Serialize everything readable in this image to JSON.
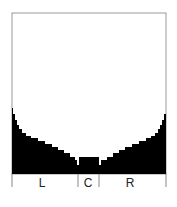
{
  "diagram": {
    "type": "histogram-profile",
    "frame": {
      "left": 12,
      "top": 13,
      "right": 166,
      "baseline": 174
    },
    "colors": {
      "fill": "#000000",
      "frame": "#999999",
      "background": "#ffffff"
    },
    "sections": [
      {
        "label": "L",
        "x_start": 12,
        "x_end": 78
      },
      {
        "label": "C",
        "x_start": 78,
        "x_end": 99
      },
      {
        "label": "R",
        "x_start": 99,
        "x_end": 166
      }
    ],
    "profile_left": [
      [
        12,
        108
      ],
      [
        13,
        114
      ],
      [
        15,
        120
      ],
      [
        17,
        125
      ],
      [
        19,
        129
      ],
      [
        22,
        133
      ],
      [
        26,
        136
      ],
      [
        31,
        138
      ],
      [
        38,
        141
      ],
      [
        45,
        144
      ],
      [
        52,
        147
      ],
      [
        58,
        150
      ],
      [
        64,
        153
      ],
      [
        70,
        157
      ],
      [
        75,
        160
      ],
      [
        77,
        165
      ]
    ],
    "profile_center": [
      [
        79,
        157
      ],
      [
        97,
        157
      ]
    ],
    "profile_right": [
      [
        99,
        165
      ],
      [
        101,
        160
      ],
      [
        107,
        157
      ],
      [
        113,
        153
      ],
      [
        119,
        150
      ],
      [
        125,
        147
      ],
      [
        132,
        144
      ],
      [
        139,
        141
      ],
      [
        146,
        138
      ],
      [
        151,
        136
      ],
      [
        155,
        133
      ],
      [
        158,
        129
      ],
      [
        160,
        125
      ],
      [
        162,
        120
      ],
      [
        164,
        114
      ],
      [
        166,
        108
      ]
    ]
  }
}
